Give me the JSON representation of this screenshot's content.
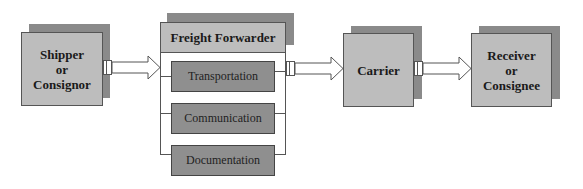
{
  "diagram": {
    "type": "flowchart",
    "nodes": {
      "shipper": {
        "label": "Shipper\nor\nConsignor"
      },
      "forwarder": {
        "label": "Freight Forwarder",
        "services": [
          {
            "label": "Transportation"
          },
          {
            "label": "Communication"
          },
          {
            "label": "Documentation"
          }
        ]
      },
      "carrier": {
        "label": "Carrier"
      },
      "receiver": {
        "label": "Receiver\nor\nConsignee"
      }
    },
    "edges": [
      {
        "from": "Shipper or Consignor",
        "to": "Freight Forwarder"
      },
      {
        "from": "Freight Forwarder",
        "to": "Carrier"
      },
      {
        "from": "Carrier",
        "to": "Receiver or Consignee"
      }
    ],
    "colors": {
      "box_fill": "#bdbdbd",
      "shadow": "#8a8a8a",
      "service_fill": "#8f8f8f",
      "border": "#555555"
    }
  }
}
